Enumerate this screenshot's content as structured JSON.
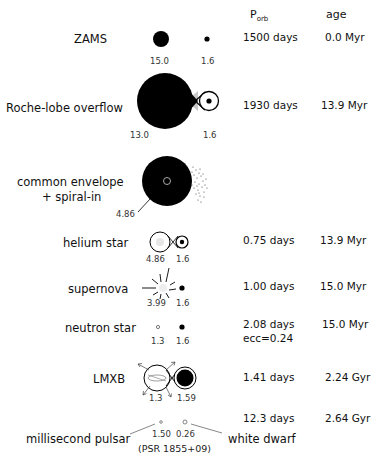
{
  "header": {
    "porb_label": "P",
    "porb_sub": "orb",
    "age_label": "age"
  },
  "stages": [
    {
      "name": "ZAMS",
      "mass1": "15.0",
      "mass2": "1.6",
      "porb": "1500 days",
      "age": "0.0 Myr"
    },
    {
      "name": "Roche-lobe overflow",
      "mass1": "13.0",
      "mass2": "1.6",
      "porb": "1930 days",
      "age": "13.9 Myr"
    },
    {
      "name_line1": "common envelope",
      "name_line2": "+ spiral-in",
      "mass1": "4.86"
    },
    {
      "name": "helium star",
      "mass1": "4.86",
      "mass2": "1.6",
      "porb": "0.75 days",
      "age": "13.9 Myr"
    },
    {
      "name": "supernova",
      "mass1": "3.99",
      "mass2": "1.6",
      "porb": "1.00 days",
      "age": "15.0 Myr"
    },
    {
      "name": "neutron star",
      "mass1": "1.3",
      "mass2": "1.6",
      "porb": "2.08 days",
      "ecc": "ecc=0.24",
      "age": "15.0 Myr"
    },
    {
      "name": "LMXB",
      "mass1": "1.3",
      "mass2": "1.59",
      "porb": "1.41 days",
      "age": "2.24 Gyr"
    },
    {
      "name_left": "millisecond pulsar",
      "name_right": "white dwarf",
      "mass1": "1.50",
      "mass2": "0.26",
      "porb": "12.3 days",
      "age": "2.64 Gyr",
      "designation": "(PSR 1855+09)"
    }
  ]
}
